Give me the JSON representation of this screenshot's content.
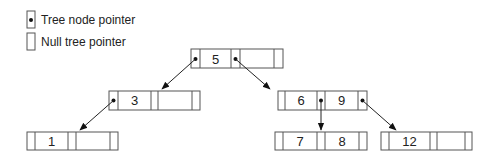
{
  "legend": {
    "items": [
      {
        "label": "Tree node pointer",
        "icon": "pointer-cell-with-dot"
      },
      {
        "label": "Null tree pointer",
        "icon": "empty-pointer-cell"
      }
    ]
  },
  "tree": {
    "type": "2-3 tree / B-tree",
    "nodes": [
      {
        "id": "root",
        "keys": [
          "5",
          ""
        ],
        "pointers": [
          true,
          true,
          false
        ]
      },
      {
        "id": "left",
        "keys": [
          "3",
          ""
        ],
        "pointers": [
          true,
          false,
          false
        ]
      },
      {
        "id": "right",
        "keys": [
          "6",
          "9"
        ],
        "pointers": [
          false,
          true,
          true
        ]
      },
      {
        "id": "leaf1",
        "keys": [
          "1",
          ""
        ],
        "pointers": [
          false,
          false,
          false
        ]
      },
      {
        "id": "leaf78",
        "keys": [
          "7",
          "8"
        ],
        "pointers": [
          false,
          false,
          false
        ]
      },
      {
        "id": "leaf12",
        "keys": [
          "12",
          ""
        ],
        "pointers": [
          false,
          false,
          false
        ]
      }
    ],
    "edges": [
      {
        "from": "root",
        "to": "left"
      },
      {
        "from": "root",
        "to": "right"
      },
      {
        "from": "left",
        "to": "leaf1"
      },
      {
        "from": "right",
        "to": "leaf78"
      },
      {
        "from": "right",
        "to": "leaf12"
      }
    ]
  },
  "labels": {
    "root_k1": "5",
    "root_k2": "",
    "left_k1": "3",
    "left_k2": "",
    "right_k1": "6",
    "right_k2": "9",
    "leaf1_k1": "1",
    "leaf1_k2": "",
    "leaf78_k1": "7",
    "leaf78_k2": "8",
    "leaf12_k1": "12",
    "leaf12_k2": ""
  }
}
